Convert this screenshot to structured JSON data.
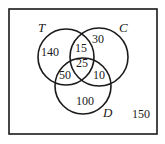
{
  "diagram": {
    "type": "venn",
    "sets": {
      "T": {
        "label": "T"
      },
      "C": {
        "label": "C"
      },
      "D": {
        "label": "D"
      }
    },
    "regions": {
      "T_only": "140",
      "C_only": "30",
      "D_only": "100",
      "T_and_C_only": "15",
      "T_and_D_only": "50",
      "C_and_D_only": "10",
      "T_and_C_and_D": "25",
      "outside": "150"
    },
    "colors": {
      "stroke": "#1a1a1a",
      "background": "#ffffff"
    }
  }
}
